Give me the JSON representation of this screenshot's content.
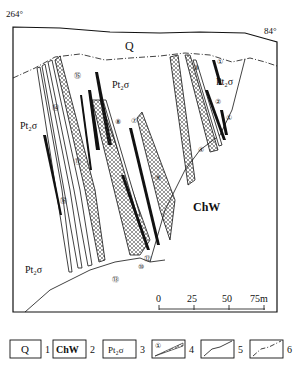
{
  "map": {
    "corner_labels": {
      "left_azimuth": "264°",
      "right_azimuth": "84°"
    },
    "unit_labels": {
      "Q": "Q",
      "ChW": "ChW",
      "Pt2o_top": "Pt₂σ",
      "Pt2o_right": "Pt₂σ",
      "Pt2o_left": "Pt₂σ",
      "Pt2o_bottom": "Pt₂σ"
    },
    "orebody_numbers": [
      "①",
      "①",
      "②",
      "③",
      "④",
      "⑦",
      "⑧",
      "⑨",
      "⑩",
      "⑪",
      "⑫",
      "⑬",
      "⑭",
      "⑮",
      "⑯"
    ],
    "scale_bar": {
      "ticks": [
        "0",
        "25",
        "50",
        "75m"
      ]
    }
  },
  "legend": {
    "items": [
      {
        "symbol": "Q",
        "number": "1",
        "meaning": "quaternary"
      },
      {
        "symbol": "ChW",
        "number": "2",
        "meaning": "ch-w formation"
      },
      {
        "symbol": "Pt₂σ",
        "number": "3",
        "meaning": "pt2-sigma unit"
      },
      {
        "symbol": "①",
        "number": "4",
        "meaning": "orebody"
      },
      {
        "symbol": "",
        "number": "5",
        "meaning": "geological boundary"
      },
      {
        "symbol": "",
        "number": "6",
        "meaning": "unconformity boundary"
      }
    ]
  }
}
